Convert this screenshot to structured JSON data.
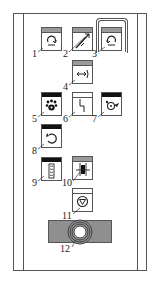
{
  "diagram": {
    "title": "",
    "panel": "control-panel-button-layout",
    "colors": {
      "line": "#555555",
      "header_gray": "#9a9a9a",
      "header_black": "#111111",
      "knob_bar": "#8f8f8f"
    },
    "callouts": [
      {
        "id": 1,
        "label": "1",
        "icon": "rotate-cw-icon",
        "header": "gray"
      },
      {
        "id": 2,
        "label": "2",
        "icon": "diagonal-double-arrow-icon",
        "header": "gray"
      },
      {
        "id": 3,
        "label": "3",
        "icon": "rotate-ccw-icon",
        "header": "gray",
        "grouped": true
      },
      {
        "id": 4,
        "label": "4",
        "icon": "arrow-to-bracket-icon",
        "header": "gray"
      },
      {
        "id": 5,
        "label": "5",
        "icon": "paw-icon",
        "header": "black"
      },
      {
        "id": 6,
        "label": "6",
        "icon": "step-line-icon",
        "header": "white"
      },
      {
        "id": 7,
        "label": "7",
        "icon": "circle-arrow-icon",
        "header": "black"
      },
      {
        "id": 8,
        "label": "8",
        "icon": "rotate-back-icon",
        "header": "black"
      },
      {
        "id": 9,
        "label": "9",
        "icon": "chain-icon",
        "header": "black"
      },
      {
        "id": 10,
        "label": "10",
        "icon": "clamp-icon",
        "header": "gray"
      },
      {
        "id": 11,
        "label": "11",
        "icon": "down-triangle-circle-icon",
        "header": "none"
      },
      {
        "id": 12,
        "label": "12",
        "icon": "knob-ring-icon",
        "header": "none"
      }
    ]
  }
}
